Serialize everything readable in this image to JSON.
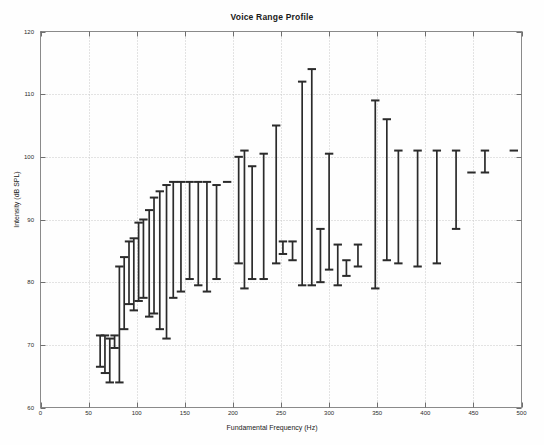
{
  "chart_data": {
    "type": "bar",
    "title": "Voice Range Profile",
    "xlabel": "Fundamental Frequency (Hz)",
    "ylabel": "Intensity (dB SPL)",
    "xlim": [
      0,
      500
    ],
    "ylim": [
      60,
      120
    ],
    "xticks": [
      0,
      50,
      100,
      150,
      200,
      250,
      300,
      350,
      400,
      450,
      500
    ],
    "yticks": [
      60,
      70,
      80,
      90,
      100,
      110,
      120
    ],
    "grid": true,
    "legend": "none",
    "series_note": "Vertical range bars with end caps: minimum and maximum intensity measured at each fundamental frequency",
    "bar_color": "#2b2b2b",
    "x": [
      62,
      67,
      72,
      77,
      82,
      87,
      92,
      97,
      102,
      107,
      113,
      118,
      124,
      131,
      138,
      146,
      155,
      164,
      173,
      183,
      194,
      206,
      212,
      220,
      232,
      245,
      252,
      262,
      272,
      282,
      291,
      300,
      309,
      318,
      330,
      348,
      360,
      372,
      392,
      412,
      432,
      448,
      462,
      492
    ],
    "ymin": [
      66.5,
      65.5,
      64.0,
      69.5,
      64.0,
      72.5,
      76.5,
      75.5,
      77.0,
      77.5,
      74.5,
      75.0,
      72.5,
      71.0,
      77.5,
      78.5,
      80.5,
      79.5,
      78.5,
      80.5,
      96.0,
      83.0,
      79.0,
      80.5,
      80.5,
      83.0,
      84.5,
      83.5,
      79.5,
      79.5,
      80.0,
      82.0,
      79.5,
      81.0,
      82.5,
      79.0,
      83.5,
      83.0,
      82.5,
      83.0,
      88.5,
      97.5,
      97.5,
      101.0
    ],
    "ymax": [
      71.5,
      71.5,
      71.0,
      71.5,
      82.5,
      84.0,
      86.5,
      87.0,
      89.5,
      90.0,
      91.5,
      93.5,
      94.5,
      95.5,
      96.0,
      96.0,
      96.0,
      96.0,
      96.0,
      95.5,
      96.0,
      100.0,
      101.0,
      98.5,
      100.5,
      105.0,
      86.5,
      86.5,
      112.0,
      114.0,
      88.5,
      100.5,
      86.0,
      83.5,
      86.0,
      109.0,
      106.0,
      101.0,
      101.0,
      101.0,
      101.0,
      97.5,
      101.0,
      101.0
    ]
  },
  "axes": {
    "xtick_labels": [
      "0",
      "50",
      "100",
      "150",
      "200",
      "250",
      "300",
      "350",
      "400",
      "450",
      "500"
    ],
    "ytick_labels": [
      "60",
      "70",
      "80",
      "90",
      "100",
      "110",
      "120"
    ]
  }
}
